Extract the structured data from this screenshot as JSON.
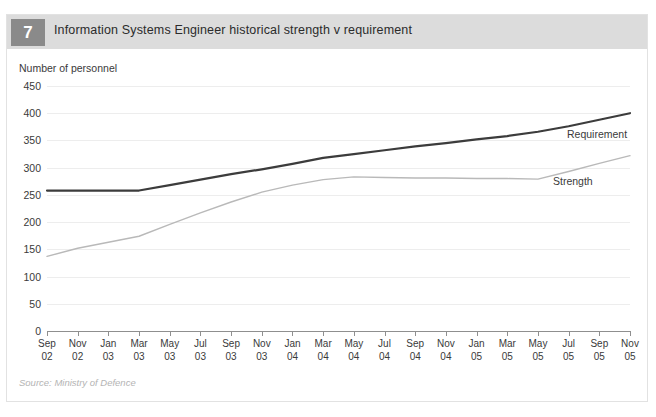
{
  "header": {
    "number": "7",
    "title": "Information Systems Engineer historical strength v requirement"
  },
  "axis_title": "Number of personnel",
  "source": "Source: Ministry of Defence",
  "labels": {
    "requirement": "Requirement",
    "strength": "Strength"
  },
  "colors": {
    "requirement_line": "#3c3c3c",
    "strength_line": "#b9b9b9",
    "header_band": "#dcdcdc",
    "badge": "#8a8a8a",
    "grid": "#ededed",
    "axis": "#8f8f8f",
    "text": "#3a3a3a",
    "source_text": "#b4b4b4"
  },
  "chart_data": {
    "type": "line",
    "title": "Information Systems Engineer historical strength v requirement",
    "xlabel": "",
    "ylabel": "Number of personnel",
    "ylim": [
      0,
      450
    ],
    "ytick_step": 50,
    "yticks": [
      0,
      50,
      100,
      150,
      200,
      250,
      300,
      350,
      400,
      450
    ],
    "grid": true,
    "legend_position": "inline-right",
    "categories": [
      "Sep 02",
      "Nov 02",
      "Jan 03",
      "Mar 03",
      "May 03",
      "Jul 03",
      "Sep 03",
      "Nov 03",
      "Jan 04",
      "Mar 04",
      "May 04",
      "Jul 04",
      "Sep 04",
      "Nov 04",
      "Jan 05",
      "Mar 05",
      "May 05",
      "Jul 05",
      "Sep 05",
      "Nov 05"
    ],
    "categories_display": [
      [
        "Sep",
        "02"
      ],
      [
        "Nov",
        "02"
      ],
      [
        "Jan",
        "03"
      ],
      [
        "Mar",
        "03"
      ],
      [
        "May",
        "03"
      ],
      [
        "Jul",
        "03"
      ],
      [
        "Sep",
        "03"
      ],
      [
        "Nov",
        "03"
      ],
      [
        "Jan",
        "04"
      ],
      [
        "Mar",
        "04"
      ],
      [
        "May",
        "04"
      ],
      [
        "Jul",
        "04"
      ],
      [
        "Sep",
        "04"
      ],
      [
        "Nov",
        "04"
      ],
      [
        "Jan",
        "05"
      ],
      [
        "Mar",
        "05"
      ],
      [
        "May",
        "05"
      ],
      [
        "Jul",
        "05"
      ],
      [
        "Sep",
        "05"
      ],
      [
        "Nov",
        "05"
      ]
    ],
    "series": [
      {
        "name": "Requirement",
        "color": "#3c3c3c",
        "width": 2.2,
        "values": [
          258,
          258,
          258,
          258,
          268,
          278,
          288,
          297,
          307,
          318,
          325,
          332,
          339,
          345,
          352,
          358,
          366,
          376,
          388,
          400
        ]
      },
      {
        "name": "Strength",
        "color": "#b9b9b9",
        "width": 1.4,
        "values": [
          137,
          152,
          163,
          174,
          196,
          217,
          237,
          255,
          268,
          278,
          283,
          282,
          281,
          281,
          280,
          280,
          279,
          293,
          308,
          322
        ]
      }
    ]
  }
}
